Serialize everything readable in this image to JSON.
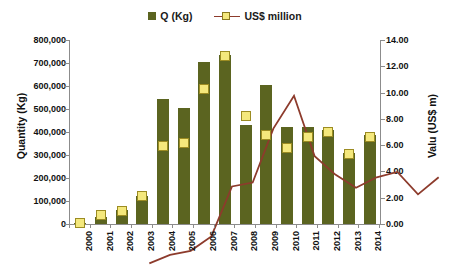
{
  "legend": {
    "position": "top-center",
    "entries": [
      {
        "label": "Q (Kg)",
        "type": "bar",
        "color": "#5b6420"
      },
      {
        "label": "US$ million",
        "type": "line",
        "color": "#8d3b2c",
        "marker_color": "#f4e87c"
      }
    ]
  },
  "axes": {
    "y_left_title": "Quantity (Kg)",
    "y_right_title": "Valu (US$ m)",
    "y_left_ticks": [
      "0",
      "100,000",
      "200,000",
      "300,000",
      "400,000",
      "500,000",
      "600,000",
      "700,000",
      "800,000"
    ],
    "y_right_ticks": [
      "0.00",
      "2.00",
      "4.00",
      "6.00",
      "8.00",
      "10.00",
      "12.00",
      "14.00"
    ],
    "x_label": ""
  },
  "chart_data": {
    "type": "bar",
    "title": "",
    "subtitle": "",
    "xlabel": "",
    "ylabel": "Quantity (Kg)",
    "y2label": "Valu (US$ m)",
    "grid": false,
    "legend_position": "top-center",
    "categories": [
      "2000",
      "2001",
      "2002",
      "2003",
      "2004",
      "2005",
      "2006",
      "2007",
      "2008",
      "2009",
      "2010",
      "2011",
      "2012",
      "2013",
      "2014"
    ],
    "ylim": [
      0,
      800000
    ],
    "y2lim": [
      0,
      14
    ],
    "series": [
      {
        "name": "Q (Kg)",
        "axis": "left",
        "type": "bar",
        "color": "#5b6420",
        "values": [
          5000,
          30000,
          60000,
          120000,
          545000,
          505000,
          705000,
          735000,
          430000,
          605000,
          420000,
          420000,
          410000,
          310000,
          385000
        ]
      },
      {
        "name": "US$ million",
        "axis": "right",
        "type": "line",
        "color": "#8d3b2c",
        "marker_color": "#f4e87c",
        "values": [
          0.05,
          0.7,
          1.0,
          2.1,
          5.9,
          6.2,
          10.3,
          12.8,
          8.2,
          6.8,
          5.8,
          6.6,
          7.0,
          5.3,
          6.6
        ]
      }
    ]
  }
}
